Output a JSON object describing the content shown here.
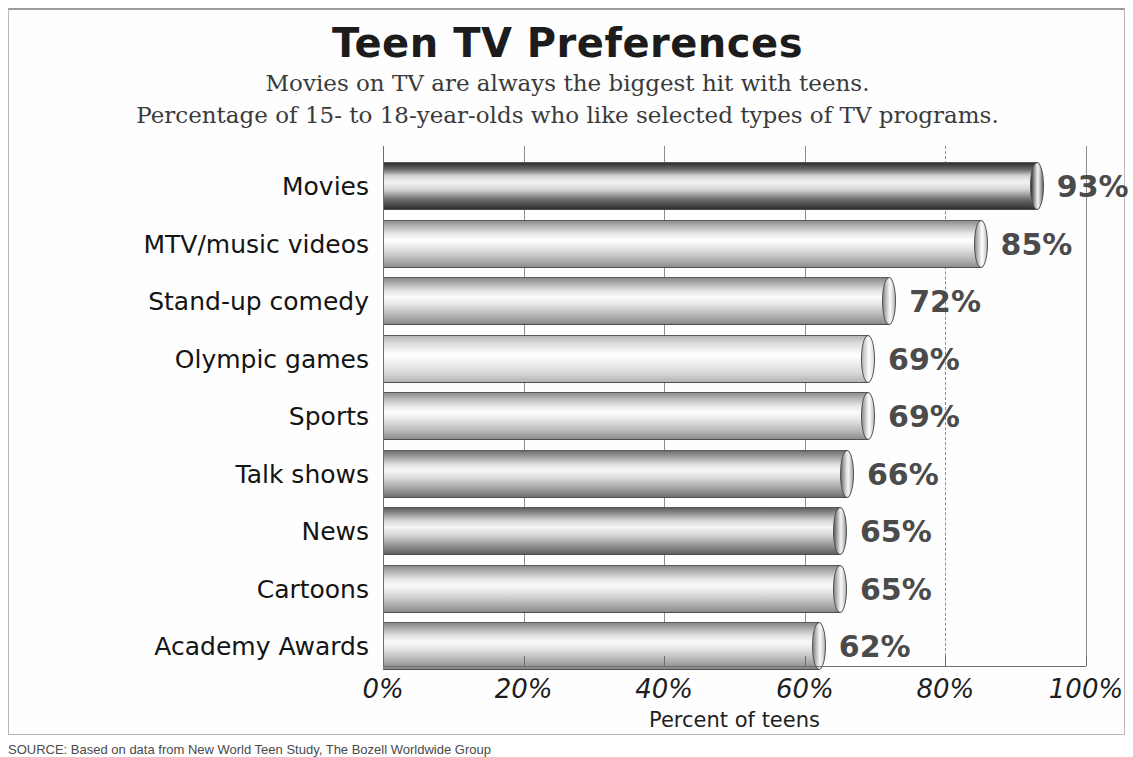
{
  "chart_data": {
    "type": "bar",
    "orientation": "horizontal",
    "title": "Teen TV Preferences",
    "subtitle1": "Movies on TV are always the biggest hit with teens.",
    "subtitle2": "Percentage of 15- to 18-year-olds who like selected types of TV programs.",
    "xlabel": "Percent of teens",
    "ylabel": "",
    "xlim": [
      0,
      100
    ],
    "grid": true,
    "legend": "none",
    "categories": [
      "Movies",
      "MTV/music videos",
      "Stand-up comedy",
      "Olympic games",
      "Sports",
      "Talk shows",
      "News",
      "Cartoons",
      "Academy Awards"
    ],
    "values": [
      93,
      85,
      72,
      69,
      69,
      66,
      65,
      65,
      62
    ],
    "value_labels": [
      "93%",
      "85%",
      "72%",
      "69%",
      "69%",
      "66%",
      "65%",
      "65%",
      "62%"
    ],
    "xticks": [
      0,
      20,
      40,
      60,
      80,
      100
    ],
    "xtick_labels": [
      "0%",
      "20%",
      "40%",
      "60%",
      "80%",
      "100%"
    ],
    "bar_shades": [
      {
        "light": "#d4d4d4",
        "highlight": "#f2f2f2",
        "dark": "#2f2f2f",
        "mid": "#6a6a6a"
      },
      {
        "light": "#e7e7e7",
        "highlight": "#ffffff",
        "dark": "#8e8e8e",
        "mid": "#bcbcbc"
      },
      {
        "light": "#e4e4e4",
        "highlight": "#fbfbfb",
        "dark": "#8a8a8a",
        "mid": "#b6b6b6"
      },
      {
        "light": "#efefef",
        "highlight": "#ffffff",
        "dark": "#b4b4b4",
        "mid": "#d8d8d8"
      },
      {
        "light": "#e6e6e6",
        "highlight": "#fdfdfd",
        "dark": "#8f8f8f",
        "mid": "#bdbdbd"
      },
      {
        "light": "#dcdcdc",
        "highlight": "#f7f7f7",
        "dark": "#6f6f6f",
        "mid": "#a4a4a4"
      },
      {
        "light": "#d8d8d8",
        "highlight": "#f4f4f4",
        "dark": "#5f5f5f",
        "mid": "#989898"
      },
      {
        "light": "#e3e3e3",
        "highlight": "#fbfbfb",
        "dark": "#8b8b8b",
        "mid": "#b8b8b8"
      },
      {
        "light": "#e2e2e2",
        "highlight": "#fafafa",
        "dark": "#868686",
        "mid": "#b5b5b5"
      }
    ]
  },
  "source": {
    "text": "SOURCE: Based on data from New World Teen Study, The Bozell Worldwide Group"
  }
}
